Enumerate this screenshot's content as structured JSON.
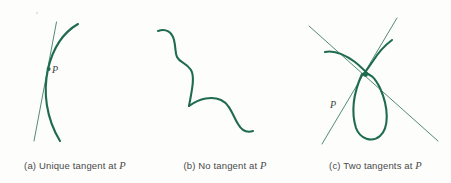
{
  "figure": {
    "width": 451,
    "height": 183,
    "background_color": "#fdfdfc",
    "curve_color": "#1f6b4f",
    "line_color": "#3b7a63",
    "caption_color": "#4a4a4a",
    "point_label": "P"
  },
  "panels": [
    {
      "id": "a",
      "caption_prefix": "(a) Unique tangent at",
      "caption_point": "P",
      "caption": "(a) Unique tangent at P",
      "point_label": "P",
      "description": "smooth curve with a single tangent line crossing at P"
    },
    {
      "id": "b",
      "caption_prefix": "(b) No tangent at",
      "caption_point": "P",
      "caption": "(b) No tangent at P",
      "point_label": "P",
      "description": "wavy curve with a sharp corner at P, no tangent line drawn"
    },
    {
      "id": "c",
      "caption_prefix": "(c) Two tangents at",
      "caption_point": "P",
      "caption": "(c) Two tangents at P",
      "point_label": "P",
      "description": "self-intersecting loop with two straight tangent lines crossing at P"
    }
  ]
}
